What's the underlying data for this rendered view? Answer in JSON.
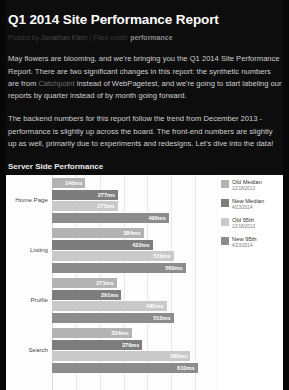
{
  "article": {
    "title": "Q1 2014 Site Performance Report",
    "byline_prefix": "Posted by",
    "byline_author": "Jonathan Klein",
    "byline_sep": "| Filed under",
    "byline_tag": "performance",
    "paragraphs": [
      {
        "before": "May flowers are blooming, and we're bringing you the Q1 2014 Site Performance Report. There are two significant changes in this report: the synthetic numbers are from ",
        "link": "Catchpoint",
        "after": " instead of WebPagetest, and we're going to start labeling our reports by quarter instead of by month going forward."
      },
      {
        "before": "The backend numbers for this report follow the trend from December 2013 - performance is slightly up across the board. The front-end numbers are slightly up as well, primarily due to experiments and redesigns. Let's dive into the data!",
        "link": "",
        "after": ""
      }
    ],
    "section_heading": "Server Side Performance",
    "section_intro": "Here are the median and 95th percentile load times for signed in users on our core pages on Wednesday, April 23rd:"
  },
  "colors": {
    "old_median": "#b3b3b3",
    "new_median": "#7d7d7d",
    "old_95th": "#c9c9c9",
    "new_95th": "#8c8c8c",
    "page_bg": "#0d0d0d",
    "chart_bg": "#ffffff"
  },
  "chart_data": {
    "type": "bar",
    "title": "",
    "xlabel": "",
    "ylabel": "",
    "orientation": "horizontal",
    "grid": true,
    "legend_position": "right",
    "xlim": [
      0,
      700
    ],
    "categories": [
      "Home Page",
      "Listing",
      "Profile",
      "Search"
    ],
    "series": [
      {
        "name": "Old Median",
        "date": "12/18/2013",
        "color": "#b3b3b3",
        "values": [
          140,
          384,
          271,
          334
        ],
        "labels": [
          "140ms",
          "384ms",
          "271ms",
          "334ms"
        ]
      },
      {
        "name": "New Median",
        "date": "4/23/2014",
        "color": "#7d7d7d",
        "values": [
          277,
          422,
          291,
          379
        ],
        "labels": [
          "277ms",
          "422ms",
          "291ms",
          "379ms"
        ]
      },
      {
        "name": "Old 95th",
        "date": "12/18/2013",
        "color": "#c9c9c9",
        "values": [
          275,
          510,
          480,
          580
        ],
        "labels": [
          "275ms",
          "510ms",
          "480ms",
          "580ms"
        ]
      },
      {
        "name": "New 95th",
        "date": "4/23/2014",
        "color": "#8c8c8c",
        "values": [
          490,
          560,
          510,
          610
        ],
        "labels": [
          "490ms",
          "560ms",
          "510ms",
          "610ms"
        ]
      }
    ]
  }
}
